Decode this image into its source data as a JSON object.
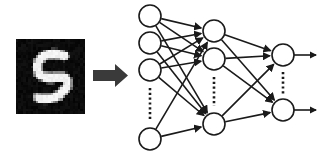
{
  "figure": {
    "title": "Handwritten digit classified by a feed-forward neural network",
    "background_color": "#ffffff",
    "width": 324,
    "height": 159
  },
  "input_image": {
    "name": "mnist-digit-sample",
    "digit_label": "5",
    "description": "Grayscale handwritten digit five, white strokes on black background",
    "background_color": "#0b0b0b",
    "stroke_color": "#f2f2f2",
    "frame": {
      "x": 16,
      "y": 39,
      "width": 69,
      "height": 75
    },
    "pixel_grid": 28
  },
  "flow_arrow": {
    "name": "block-arrow",
    "color": "#3a3a3a",
    "direction": "right",
    "shaft": {
      "x": 93,
      "y": 70,
      "width": 22,
      "height": 11
    },
    "head": {
      "x": 115,
      "y": 64,
      "width": 13,
      "height": 23
    }
  },
  "network": {
    "stroke_color": "#1a1a1a",
    "node_fill": "#ffffff",
    "node_radius": 11,
    "edge_width": 1.6,
    "node_stroke_width": 1.6,
    "layers": [
      {
        "name": "input-layer",
        "label": "Input layer",
        "x": 150,
        "nodes": [
          {
            "id": "i1",
            "cy": 16
          },
          {
            "id": "i2",
            "cy": 43
          },
          {
            "id": "i3",
            "cy": 70
          },
          {
            "id": "i4",
            "cy": 139
          }
        ],
        "ellipsis": {
          "x": 150,
          "y1": 88,
          "y2": 120
        }
      },
      {
        "name": "hidden-layer",
        "label": "Hidden layer",
        "x": 214,
        "nodes": [
          {
            "id": "h1",
            "cy": 31
          },
          {
            "id": "h2",
            "cy": 59
          },
          {
            "id": "h3",
            "cy": 124
          }
        ],
        "ellipsis": {
          "x": 214,
          "y1": 77,
          "y2": 106
        }
      },
      {
        "name": "output-layer",
        "label": "Output layer",
        "x": 283,
        "nodes": [
          {
            "id": "o1",
            "cy": 55
          },
          {
            "id": "o2",
            "cy": 110
          }
        ],
        "ellipsis": {
          "x": 283,
          "y1": 72,
          "y2": 94
        }
      }
    ],
    "connections": [
      {
        "from": "i1",
        "to": "h1"
      },
      {
        "from": "i1",
        "to": "h2"
      },
      {
        "from": "i1",
        "to": "h3"
      },
      {
        "from": "i2",
        "to": "h1"
      },
      {
        "from": "i2",
        "to": "h2"
      },
      {
        "from": "i2",
        "to": "h3"
      },
      {
        "from": "i3",
        "to": "h1"
      },
      {
        "from": "i3",
        "to": "h2"
      },
      {
        "from": "i3",
        "to": "h3"
      },
      {
        "from": "i4",
        "to": "h1"
      },
      {
        "from": "i4",
        "to": "h3"
      },
      {
        "from": "h1",
        "to": "o1"
      },
      {
        "from": "h1",
        "to": "o2"
      },
      {
        "from": "h2",
        "to": "o1"
      },
      {
        "from": "h2",
        "to": "o2"
      },
      {
        "from": "h3",
        "to": "o1"
      },
      {
        "from": "h3",
        "to": "o2"
      }
    ],
    "output_arrows": [
      {
        "id": "out1",
        "from_node": "o1",
        "y": 55,
        "x1": 294,
        "x2": 320
      },
      {
        "id": "out2",
        "from_node": "o2",
        "y": 110,
        "x1": 294,
        "x2": 320
      }
    ]
  }
}
